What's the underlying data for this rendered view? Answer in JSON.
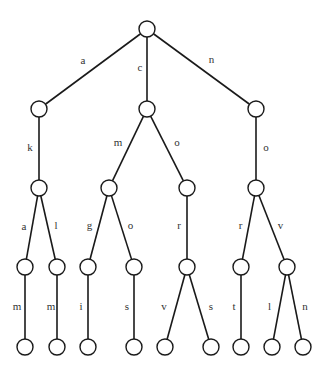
{
  "diagram": {
    "type": "trie",
    "root": "root",
    "nodes": [
      {
        "id": "root"
      },
      {
        "id": "a"
      },
      {
        "id": "c"
      },
      {
        "id": "n"
      },
      {
        "id": "ak"
      },
      {
        "id": "cm"
      },
      {
        "id": "co"
      },
      {
        "id": "no"
      },
      {
        "id": "aka"
      },
      {
        "id": "akl"
      },
      {
        "id": "cmg"
      },
      {
        "id": "cmo"
      },
      {
        "id": "cor"
      },
      {
        "id": "nor"
      },
      {
        "id": "nov"
      },
      {
        "id": "akam"
      },
      {
        "id": "aklm"
      },
      {
        "id": "cmgi"
      },
      {
        "id": "cmos"
      },
      {
        "id": "corv"
      },
      {
        "id": "cors"
      },
      {
        "id": "nort"
      },
      {
        "id": "novl"
      },
      {
        "id": "novn"
      }
    ],
    "edges": [
      {
        "from": "root",
        "to": "a",
        "label": "a"
      },
      {
        "from": "root",
        "to": "c",
        "label": "c"
      },
      {
        "from": "root",
        "to": "n",
        "label": "n"
      },
      {
        "from": "a",
        "to": "ak",
        "label": "k"
      },
      {
        "from": "c",
        "to": "cm",
        "label": "m"
      },
      {
        "from": "c",
        "to": "co",
        "label": "o"
      },
      {
        "from": "n",
        "to": "no",
        "label": "o"
      },
      {
        "from": "ak",
        "to": "aka",
        "label": "a"
      },
      {
        "from": "ak",
        "to": "akl",
        "label": "l"
      },
      {
        "from": "cm",
        "to": "cmg",
        "label": "g"
      },
      {
        "from": "cm",
        "to": "cmo",
        "label": "o"
      },
      {
        "from": "co",
        "to": "cor",
        "label": "r"
      },
      {
        "from": "no",
        "to": "nor",
        "label": "r"
      },
      {
        "from": "no",
        "to": "nov",
        "label": "v"
      },
      {
        "from": "aka",
        "to": "akam",
        "label": "m"
      },
      {
        "from": "akl",
        "to": "aklm",
        "label": "m"
      },
      {
        "from": "cmg",
        "to": "cmgi",
        "label": "i"
      },
      {
        "from": "cmo",
        "to": "cmos",
        "label": "s"
      },
      {
        "from": "cor",
        "to": "corv",
        "label": "v"
      },
      {
        "from": "cor",
        "to": "cors",
        "label": "s"
      },
      {
        "from": "nor",
        "to": "nort",
        "label": "t"
      },
      {
        "from": "nov",
        "to": "novl",
        "label": "l"
      },
      {
        "from": "nov",
        "to": "novn",
        "label": "n"
      }
    ]
  }
}
